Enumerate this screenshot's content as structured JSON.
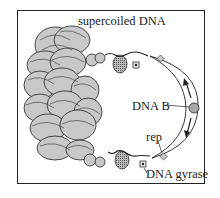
{
  "diagram": {
    "labels": {
      "supercoiled": "supercoiled DNA",
      "dnab": "DNA B",
      "rep": "rep",
      "gyrase": "DNA gyrase"
    },
    "colors": {
      "coil_fill": "#c8c8c8",
      "stroke": "#222222",
      "dnab_fill": "#a8a8a8",
      "background": "#ffffff"
    },
    "components": [
      "supercoiled DNA mass",
      "relaxed coil loops",
      "DNA gyrase (x2)",
      "rep helicase (x2)",
      "DNA B helicase",
      "replication fork arrows (x2)",
      "single-stranded bubble"
    ]
  }
}
